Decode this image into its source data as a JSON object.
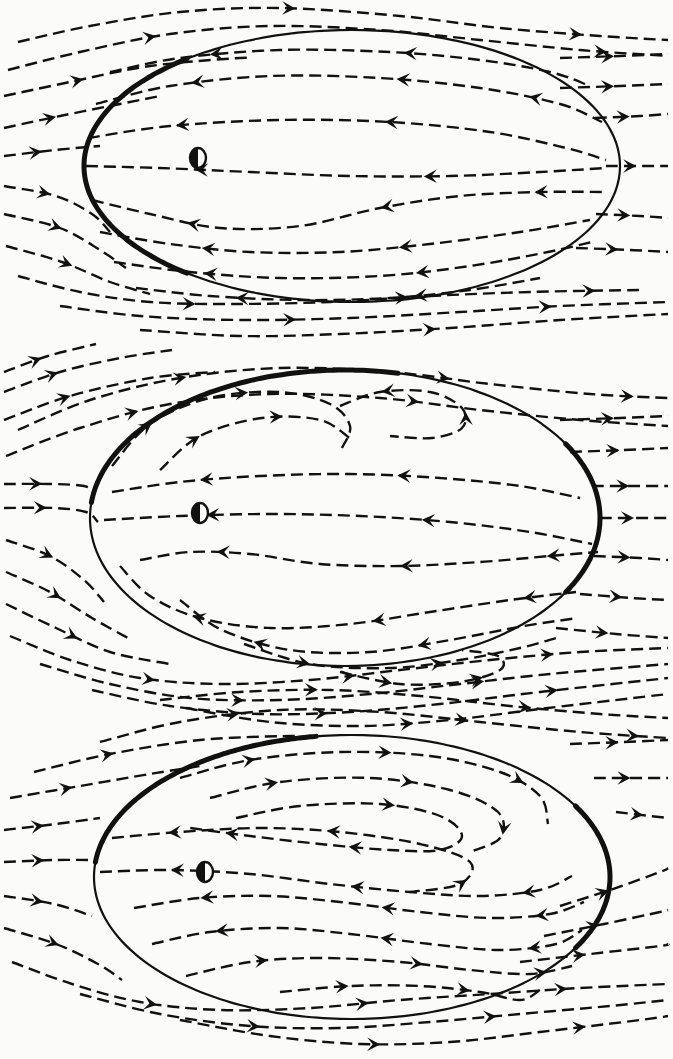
{
  "figure": {
    "title": "Streamline patterns of flow past three oval bodies",
    "background_color": "#fbfbf9",
    "line_color": "#111111",
    "dash_pattern": "12 6",
    "stroke_width_streamline": 2.4,
    "stroke_width_boundary_thin": 2.2,
    "stroke_width_boundary_thick": 5.0,
    "arrowhead_style": "solid-barbed-triangle",
    "panel_count": 3
  },
  "center_marker": {
    "icon": "half-filled-circle-icon",
    "description": "small circle, left half filled black, right half white",
    "radius_x": 8,
    "radius_y": 10,
    "fill_left": "#111111",
    "fill_right": "#fbfbf9"
  },
  "panels": [
    {
      "id": "panel-1",
      "label": "Top panel",
      "oval": {
        "cx": 352,
        "cy": 166,
        "rx": 268,
        "ry": 136
      },
      "marker": {
        "cx": 198,
        "cy": 158
      },
      "thick_arc_ranges_deg": [
        [
          128,
          232
        ]
      ],
      "interior_flow_direction": "leftward",
      "exterior_flow_direction": "rightward",
      "interior_streamline_count": 8,
      "exterior_streamline_count": 10,
      "recirculation": "weak"
    },
    {
      "id": "panel-2",
      "label": "Middle panel",
      "oval": {
        "cx": 345,
        "cy": 518,
        "rx": 255,
        "ry": 148
      },
      "marker": {
        "cx": 200,
        "cy": 513
      },
      "thick_arc_ranges_deg": [
        [
          186,
          282
        ],
        [
          330,
          30
        ]
      ],
      "interior_flow_direction": "leftward",
      "exterior_flow_direction": "rightward",
      "interior_streamline_count": 9,
      "exterior_streamline_count": 11,
      "recirculation": "moderate"
    },
    {
      "id": "panel-3",
      "label": "Bottom panel",
      "oval": {
        "cx": 352,
        "cy": 877,
        "rx": 258,
        "ry": 142
      },
      "marker": {
        "cx": 205,
        "cy": 872
      },
      "thick_arc_ranges_deg": [
        [
          186,
          262
        ],
        [
          330,
          30
        ]
      ],
      "interior_flow_direction": "closed-recirculating",
      "exterior_flow_direction": "rightward",
      "interior_streamline_count": 9,
      "exterior_streamline_count": 11,
      "recirculation": "strong"
    }
  ],
  "chart_data": {
    "type": "line",
    "title": "Streamline patterns of flow past three oval bodies",
    "xlabel": "",
    "ylabel": "",
    "legend": [],
    "grid": false,
    "series": [
      {
        "name": "panel-1-interior",
        "values": []
      },
      {
        "name": "panel-1-exterior",
        "values": []
      },
      {
        "name": "panel-2-interior",
        "values": []
      },
      {
        "name": "panel-2-exterior",
        "values": []
      },
      {
        "name": "panel-3-interior",
        "values": []
      },
      {
        "name": "panel-3-exterior",
        "values": []
      }
    ]
  }
}
